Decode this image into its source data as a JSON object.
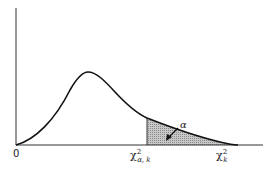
{
  "figure": {
    "type": "chi-square density curve with shaded upper tail",
    "origin_label": "0",
    "critical_value_label": {
      "base": "χ",
      "sup": "2",
      "sub": "α, k"
    },
    "axis_variable_label": {
      "base": "χ",
      "sup": "2",
      "sub": "k"
    },
    "tail_area_label": "α",
    "colors": {
      "curve": "#111111",
      "shade": "#b0b0b0",
      "axis": "#333333"
    }
  }
}
